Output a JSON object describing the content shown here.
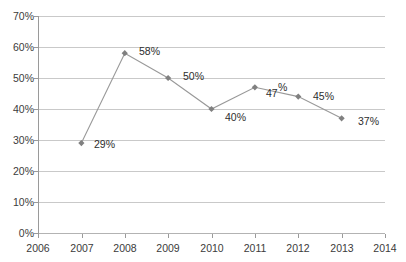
{
  "chart_data": {
    "type": "line",
    "title": "",
    "subtitle": "",
    "xlabel": "",
    "ylabel": "",
    "grid": true,
    "legend": "none",
    "xlim": [
      2006,
      2014
    ],
    "ylim": [
      0,
      70
    ],
    "x_tick_labels": [
      "2006",
      "2007",
      "2008",
      "2009",
      "2010",
      "2011",
      "2012",
      "2013",
      "2014"
    ],
    "y_tick_labels": [
      "0%",
      "10%",
      "20%",
      "30%",
      "40%",
      "50%",
      "60%",
      "70%"
    ],
    "y_tick_values": [
      0,
      10,
      20,
      30,
      40,
      50,
      60,
      70
    ],
    "x": [
      2007,
      2008,
      2009,
      2010,
      2011,
      2012,
      2013
    ],
    "values": [
      29,
      58,
      50,
      40,
      47,
      44,
      37
    ],
    "data_labels": [
      "29%",
      "58%",
      "50%",
      "40%",
      "47%",
      "45%",
      "37%"
    ],
    "series": [
      {
        "name": "series-1",
        "x": [
          2007,
          2008,
          2009,
          2010,
          2011,
          2012,
          2013
        ],
        "values": [
          29,
          58,
          50,
          40,
          47,
          44,
          37
        ],
        "labels": [
          "29%",
          "58%",
          "50%",
          "40%",
          "47%",
          "45%",
          "37%"
        ],
        "line_color": "#999999",
        "marker_color": "#808080",
        "marker": "diamond"
      }
    ],
    "colors": {
      "line": "#999999",
      "marker": "#808080",
      "grid": "#c9c9c9",
      "axis": "#9a9a9a",
      "text": "#3b3b3b",
      "background": "#ffffff"
    },
    "label_offsets": [
      {
        "label": "29%",
        "dx": 12,
        "dy": -4
      },
      {
        "label": "58%",
        "dx": 12,
        "dy": -12
      },
      {
        "label": "50%",
        "dx": 12,
        "dy": -10
      },
      {
        "label": "40%",
        "dx": 12,
        "dy": 2
      },
      {
        "label": "47%",
        "dx": 6,
        "dy": -2,
        "split": true
      },
      {
        "label": "45%",
        "dx": 12,
        "dy": -4
      },
      {
        "label": "37%",
        "dx": 12,
        "dy": -2
      }
    ]
  },
  "labels": {
    "y": {
      "t70": "70%",
      "t60": "60%",
      "t50": "50%",
      "t40": "40%",
      "t30": "30%",
      "t20": "20%",
      "t10": "10%",
      "t0": "0%"
    },
    "x": {
      "y2006": "2006",
      "y2007": "2007",
      "y2008": "2008",
      "y2009": "2009",
      "y2010": "2010",
      "y2011": "2011",
      "y2012": "2012",
      "y2013": "2013",
      "y2014": "2014"
    },
    "points": {
      "p2007": "29%",
      "p2008": "58%",
      "p2009": "50%",
      "p2010": "40%",
      "p2011_num": "47",
      "p2011_sym": "%",
      "p2012": "45%",
      "p2013": "37%"
    }
  }
}
